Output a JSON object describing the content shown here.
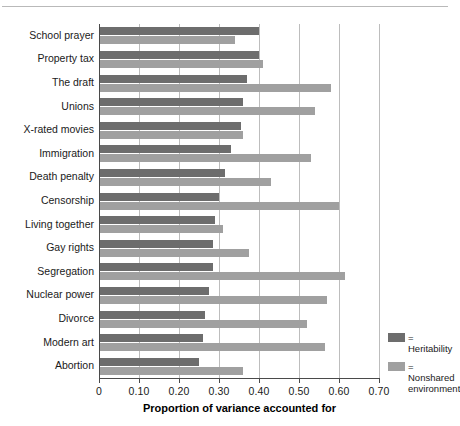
{
  "chart_data": {
    "type": "bar",
    "orientation": "horizontal",
    "title": "",
    "xlabel": "Proportion of variance accounted for",
    "ylabel": "",
    "xlim": [
      0,
      0.7
    ],
    "xticks": [
      0,
      0.1,
      0.2,
      0.3,
      0.4,
      0.5,
      0.6,
      0.7
    ],
    "xtick_labels": [
      "0",
      "0.10",
      "0.20",
      "0.30",
      "0.40",
      "0.50",
      "0.60",
      "0.70"
    ],
    "grid": "vertical",
    "legend_position": "bottom-right",
    "categories": [
      "School prayer",
      "Property tax",
      "The draft",
      "Unions",
      "X-rated movies",
      "Immigration",
      "Death penalty",
      "Censorship",
      "Living together",
      "Gay rights",
      "Segregation",
      "Nuclear power",
      "Divorce",
      "Modern art",
      "Abortion"
    ],
    "series": [
      {
        "name": "Heritability",
        "color": "#6d6d6d",
        "values": [
          0.4,
          0.4,
          0.37,
          0.36,
          0.355,
          0.33,
          0.315,
          0.3,
          0.29,
          0.285,
          0.285,
          0.275,
          0.265,
          0.26,
          0.25
        ]
      },
      {
        "name": "Nonshared environment",
        "color": "#a0a0a0",
        "values": [
          0.34,
          0.41,
          0.58,
          0.54,
          0.36,
          0.53,
          0.43,
          0.6,
          0.31,
          0.375,
          0.615,
          0.57,
          0.52,
          0.565,
          0.36
        ]
      }
    ]
  },
  "legend": {
    "items": [
      {
        "label": "= Heritability",
        "color": "#6d6d6d",
        "icon": "legend-swatch-icon"
      },
      {
        "label": "= Nonshared\nenvironment",
        "color": "#a0a0a0",
        "icon": "legend-swatch-icon"
      }
    ]
  }
}
